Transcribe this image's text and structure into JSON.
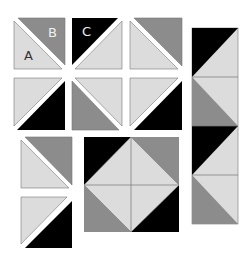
{
  "colors": {
    "light": "#dcdcdc",
    "medium": "#8c8c8c",
    "dark": "#000000",
    "background": "#ffffff",
    "seam": "#777777"
  },
  "labels": {
    "a": "A",
    "b": "B",
    "c": "C"
  },
  "diagram": {
    "top_grid": {
      "rows": 2,
      "cols": 3,
      "units": [
        {
          "row": 0,
          "col": 0,
          "diagonal": "tl-br",
          "upper": "medium",
          "lower": "light",
          "label_upper": "B",
          "label_lower": "A"
        },
        {
          "row": 0,
          "col": 1,
          "diagonal": "tr-bl",
          "upper": "dark",
          "lower": "light",
          "label_upper": "C"
        },
        {
          "row": 0,
          "col": 2,
          "diagonal": "tl-br",
          "upper": "medium",
          "lower": "light"
        },
        {
          "row": 1,
          "col": 0,
          "diagonal": "tr-bl",
          "upper": "light",
          "lower": "dark"
        },
        {
          "row": 1,
          "col": 1,
          "diagonal": "tl-br",
          "upper": "light",
          "lower": "medium"
        },
        {
          "row": 1,
          "col": 2,
          "diagonal": "tr-bl",
          "upper": "light",
          "lower": "dark"
        }
      ]
    },
    "left_column_units": [
      {
        "diagonal": "tl-br",
        "upper": "medium",
        "lower": "light"
      },
      {
        "diagonal": "tr-bl",
        "upper": "light",
        "lower": "dark"
      }
    ],
    "center_block": "square-in-a-square: light diamond, corners dark/medium/medium/dark",
    "right_strip": [
      "dark/light",
      "medium/light",
      "dark/light",
      "medium/light"
    ]
  }
}
